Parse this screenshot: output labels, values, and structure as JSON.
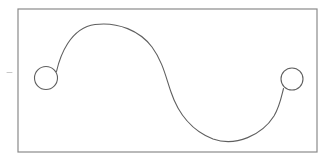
{
  "figure": {
    "title": "S-curve diagram with two circular nodes inside a rectangular frame",
    "canvas": {
      "width": 334,
      "height": 159,
      "background_color": "#ffffff"
    },
    "frame": {
      "name": "rectangular border",
      "x": 18,
      "y": 9,
      "width": 299,
      "height": 143,
      "stroke_color": "#8a8a8a",
      "stroke_width": 1.2,
      "fill": "none"
    },
    "left_node": {
      "name": "left circle node",
      "cx": 46,
      "cy": 78,
      "r": 11.5,
      "stroke_color": "#5f5f5f",
      "stroke_width": 1.1,
      "fill": "none"
    },
    "right_node": {
      "name": "right circle node",
      "cx": 292,
      "cy": 79,
      "r": 11,
      "stroke_color": "#5f5f5f",
      "stroke_width": 1.1,
      "fill": "none"
    },
    "curve": {
      "name": "sigmoid S-curve connector",
      "path": "M 56.5 71.5 C 60 56 70 28 95 24.5 C 118 21.5 140 31 152 47 C 163 62 166 78 171 92 C 178 113 192 131 213 139 C 236 147 262 135 274 116 C 280 106 281.5 96 283.5 88.5",
      "stroke_color": "#5f5f5f",
      "stroke_width": 1.1,
      "fill": "none",
      "start_point": [
        56.5,
        71.5
      ],
      "end_point": [
        283.5,
        88.5
      ],
      "crest": {
        "x": 113,
        "y": 24
      },
      "inflection": {
        "x": 170,
        "y": 82
      },
      "trough": {
        "x": 222,
        "y": 140
      }
    },
    "tick_mark": {
      "name": "faint tick mark left of frame",
      "x1": 7,
      "y1": 72.5,
      "x2": 12,
      "y2": 72.5,
      "stroke_color": "#c8c8c8",
      "stroke_width": 1
    }
  }
}
